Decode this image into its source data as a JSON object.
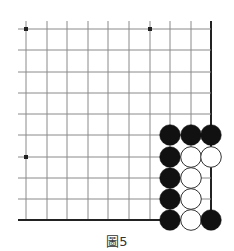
{
  "diagram": {
    "type": "go-board-corner",
    "caption": "圖5",
    "grid": {
      "columns_x": [
        26,
        47,
        67,
        88,
        108,
        129,
        150,
        170,
        191,
        211
      ],
      "rows_y": [
        29,
        50,
        72,
        93,
        114,
        135,
        157,
        178,
        199,
        220
      ],
      "line_color": "#8a8a8a",
      "edge_color": "#222222",
      "thick_edges": [
        "right",
        "bottom"
      ],
      "extend_left": 8,
      "extend_top": 8
    },
    "star_points": [
      {
        "col": 0,
        "row": 0
      },
      {
        "col": 6,
        "row": 0
      },
      {
        "col": 0,
        "row": 6
      }
    ],
    "stones": [
      {
        "col": 7,
        "row": 5,
        "color": "black"
      },
      {
        "col": 8,
        "row": 5,
        "color": "black"
      },
      {
        "col": 9,
        "row": 5,
        "color": "black"
      },
      {
        "col": 7,
        "row": 6,
        "color": "black"
      },
      {
        "col": 8,
        "row": 6,
        "color": "white"
      },
      {
        "col": 9,
        "row": 6,
        "color": "white"
      },
      {
        "col": 7,
        "row": 7,
        "color": "black"
      },
      {
        "col": 8,
        "row": 7,
        "color": "white"
      },
      {
        "col": 7,
        "row": 8,
        "color": "black"
      },
      {
        "col": 8,
        "row": 8,
        "color": "white"
      },
      {
        "col": 7,
        "row": 9,
        "color": "black"
      },
      {
        "col": 8,
        "row": 9,
        "color": "white"
      },
      {
        "col": 9,
        "row": 9,
        "color": "black"
      }
    ],
    "colors": {
      "black_stone": "#111111",
      "white_stone": "#ffffff",
      "white_stone_outline": "#333333"
    }
  }
}
